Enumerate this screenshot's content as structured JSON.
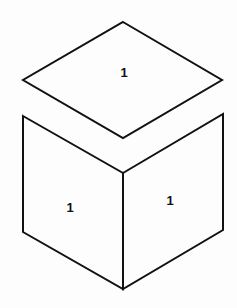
{
  "diagram": {
    "title": "",
    "stroke_color": "#111111",
    "background": "#fdfdfd",
    "faces": [
      {
        "id": "top",
        "label": "1",
        "points": "123,22 222,80 123,138 23,80",
        "label_x": 124,
        "label_y": 77
      },
      {
        "id": "left",
        "label": "1",
        "points": "23,116 123,173 123,289 23,232",
        "label_x": 70,
        "label_y": 212
      },
      {
        "id": "right",
        "label": "1",
        "points": "123,173 223,114 223,230 123,289",
        "label_x": 170,
        "label_y": 205
      }
    ]
  }
}
